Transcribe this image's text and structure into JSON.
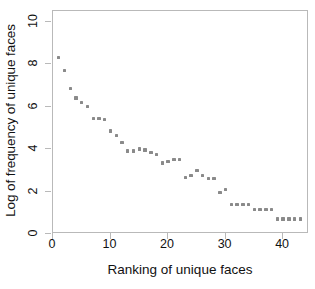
{
  "chart_data": {
    "type": "scatter",
    "title": "",
    "xlabel": "Ranking of unique faces",
    "ylabel": "Log of frequency of unique faces",
    "xlim": [
      0,
      44.5
    ],
    "ylim": [
      0,
      10.5
    ],
    "xticks": [
      0,
      10,
      20,
      30,
      40
    ],
    "yticks": [
      0,
      2,
      4,
      6,
      8,
      10
    ],
    "xtick_labels": [
      "0",
      "10",
      "20",
      "30",
      "40"
    ],
    "ytick_labels": [
      "0",
      "2",
      "4",
      "6",
      "8",
      "10"
    ],
    "grid": false,
    "legend": null,
    "legend_position": "none",
    "marker": {
      "shape": "square",
      "color": "#8a8a8a",
      "size_px": 3.4
    },
    "series": [
      {
        "name": "unique faces",
        "x": [
          1,
          2,
          3,
          4,
          5,
          6,
          7,
          8,
          9,
          10,
          11,
          12,
          13,
          14,
          15,
          16,
          17,
          18,
          19,
          20,
          21,
          22,
          23,
          24,
          25,
          26,
          27,
          28,
          29,
          30,
          31,
          32,
          33,
          34,
          35,
          36,
          37,
          38,
          39,
          40,
          41,
          42,
          43
        ],
        "y": [
          8.3,
          7.7,
          6.85,
          6.4,
          6.2,
          6.0,
          5.45,
          5.45,
          5.4,
          4.85,
          4.65,
          4.3,
          3.9,
          3.9,
          4.0,
          3.95,
          3.85,
          3.75,
          3.35,
          3.4,
          3.5,
          3.5,
          2.65,
          2.75,
          3.0,
          2.75,
          2.6,
          2.6,
          1.95,
          2.1,
          1.4,
          1.4,
          1.4,
          1.4,
          1.15,
          1.15,
          1.15,
          1.15,
          0.7,
          0.7,
          0.7,
          0.7,
          0.7
        ]
      }
    ]
  }
}
